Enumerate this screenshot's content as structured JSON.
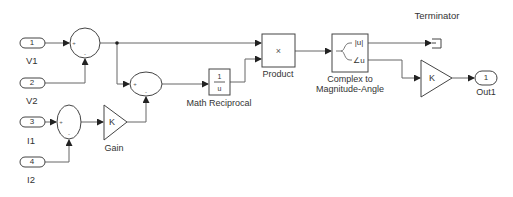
{
  "diagram": {
    "type": "simulink-block-diagram",
    "colors": {
      "line": "#555555",
      "block_border": "#444444",
      "text": "#333333",
      "background": "#ffffff"
    },
    "blocks": {
      "in1": {
        "type": "Inport",
        "number": "1",
        "label": "V1"
      },
      "in2": {
        "type": "Inport",
        "number": "2",
        "label": "V2"
      },
      "in3": {
        "type": "Inport",
        "number": "3",
        "label": "I1"
      },
      "in4": {
        "type": "Inport",
        "number": "4",
        "label": "I2"
      },
      "sum1": {
        "type": "Sum",
        "signs": [
          "+",
          "-"
        ]
      },
      "sum2": {
        "type": "Sum",
        "signs": [
          "+",
          "-"
        ]
      },
      "sum3": {
        "type": "Sum",
        "signs": [
          "+",
          "-"
        ]
      },
      "gain1": {
        "type": "Gain",
        "symbol": "K",
        "label": "Gain"
      },
      "reciprocal": {
        "type": "Math Function",
        "numerator": "1",
        "denominator": "u",
        "label": "Math Reciprocal"
      },
      "product": {
        "type": "Product",
        "symbol": "×",
        "label": "Product"
      },
      "c2ma": {
        "type": "Complex to Magnitude-Angle",
        "port_mag": "|u|",
        "port_angle": "∠u",
        "label_line1": "Complex to",
        "label_line2": "Magnitude-Angle"
      },
      "terminator": {
        "type": "Terminator",
        "label": "Terminator"
      },
      "gain2": {
        "type": "Gain",
        "symbol": "K"
      },
      "out1": {
        "type": "Outport",
        "number": "1",
        "label": "Out1"
      }
    },
    "connections": [
      {
        "from": "in1",
        "to": "sum1:+"
      },
      {
        "from": "in2",
        "to": "sum1:-"
      },
      {
        "from": "sum1",
        "to": "product:1"
      },
      {
        "from": "sum1",
        "to": "sum3:+"
      },
      {
        "from": "in3",
        "to": "sum2:+"
      },
      {
        "from": "in4",
        "to": "sum2:-"
      },
      {
        "from": "sum2",
        "to": "gain1"
      },
      {
        "from": "gain1",
        "to": "sum3:-"
      },
      {
        "from": "sum3",
        "to": "reciprocal"
      },
      {
        "from": "reciprocal",
        "to": "product:2"
      },
      {
        "from": "product",
        "to": "c2ma"
      },
      {
        "from": "c2ma:|u|",
        "to": "terminator"
      },
      {
        "from": "c2ma:∠u",
        "to": "gain2"
      },
      {
        "from": "gain2",
        "to": "out1"
      }
    ]
  }
}
